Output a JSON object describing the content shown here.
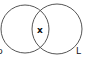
{
  "diagram": {
    "type": "venn",
    "circles": [
      {
        "name": "left",
        "label": "p",
        "cx": 25,
        "cy": 29,
        "r": 24
      },
      {
        "name": "right",
        "label": "L",
        "cx": 57,
        "cy": 29,
        "r": 25
      }
    ],
    "intersection_label": "x",
    "stroke_color": "#555555"
  }
}
